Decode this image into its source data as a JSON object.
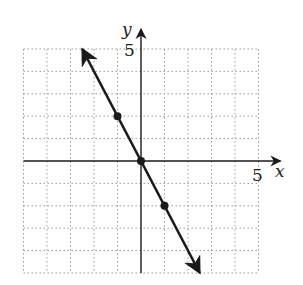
{
  "chart_data": {
    "type": "line",
    "title": "",
    "xlabel": "x",
    "ylabel": "y",
    "xlim": [
      -5,
      5
    ],
    "ylim": [
      -5,
      5
    ],
    "grid": true,
    "grid_style": "dotted",
    "tick_labels": {
      "x": "5",
      "y": "5"
    },
    "series": [
      {
        "name": "y = -2x",
        "equation": "y = -2x",
        "slope": -2,
        "intercept": 0,
        "arrows": "both",
        "line_start": {
          "x": -2.5,
          "y": 5
        },
        "line_end": {
          "x": 2.5,
          "y": -5
        },
        "points": [
          {
            "x": -1,
            "y": 2
          },
          {
            "x": 0,
            "y": 0
          },
          {
            "x": 1,
            "y": -2
          }
        ]
      }
    ]
  },
  "labels": {
    "x_axis": "x",
    "y_axis": "y",
    "x_tick": "5",
    "y_tick": "5"
  },
  "colors": {
    "line": "#1a1a1a",
    "grid": "#9a9a9a",
    "axis": "#1a1a1a"
  }
}
